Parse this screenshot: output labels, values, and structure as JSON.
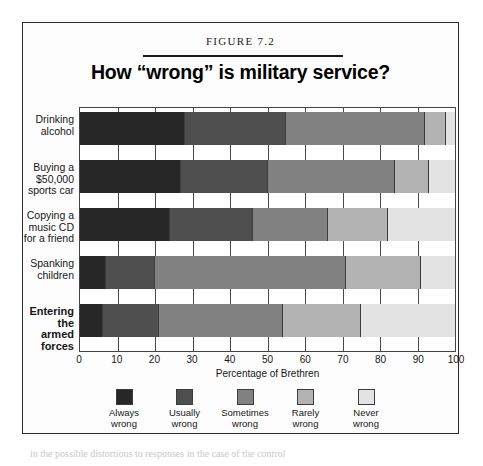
{
  "figure": {
    "number_label": "FIGURE 7.2",
    "title": "How “wrong” is military service?",
    "body_text_below": "in the possible distortions to responses in the case of the control"
  },
  "chart_data": {
    "type": "bar",
    "orientation": "horizontal",
    "stacked": true,
    "normalized": true,
    "title": "How “wrong” is military service?",
    "subtitle": "FIGURE 7.2",
    "xlabel": "Percentage of Brethren",
    "ylabel": "",
    "xlim": [
      0,
      100
    ],
    "xticks": [
      0,
      10,
      20,
      30,
      40,
      50,
      60,
      70,
      80,
      90,
      100
    ],
    "xtick_labels": [
      "0",
      "10",
      "20",
      "30",
      "40",
      "50",
      "60",
      "70",
      "80",
      "90",
      "100"
    ],
    "grid": true,
    "legend_position": "bottom",
    "categories": [
      "Drinking alcohol",
      "Buying a $50,000 sports car",
      "Copying a music CD for a friend",
      "Spanking children",
      "Entering the armed forces"
    ],
    "category_lines": [
      [
        "Drinking",
        "alcohol"
      ],
      [
        "Buying a",
        "$50,000",
        "sports car"
      ],
      [
        "Copying a",
        "music CD",
        "for a friend"
      ],
      [
        "Spanking",
        "children"
      ],
      [
        "Entering",
        "the",
        "armed",
        "forces"
      ]
    ],
    "category_emphasis": [
      false,
      false,
      false,
      false,
      true
    ],
    "series": [
      {
        "name": "Always wrong",
        "legend_lines": [
          "Always",
          "wrong"
        ],
        "color": "#272727",
        "values": [
          28,
          27,
          24,
          7,
          6
        ]
      },
      {
        "name": "Usually wrong",
        "legend_lines": [
          "Usually",
          "wrong"
        ],
        "color": "#4f4f4f",
        "values": [
          27,
          23,
          22,
          13,
          15
        ]
      },
      {
        "name": "Sometimes wrong",
        "legend_lines": [
          "Sometimes",
          "wrong"
        ],
        "color": "#828282",
        "values": [
          37,
          34,
          20,
          51,
          33
        ]
      },
      {
        "name": "Rarely wrong",
        "legend_lines": [
          "Rarely",
          "wrong"
        ],
        "color": "#b3b3b3",
        "values": [
          5.5,
          9,
          16,
          20,
          21
        ]
      },
      {
        "name": "Never wrong",
        "legend_lines": [
          "Never",
          "wrong"
        ],
        "color": "#e3e3e3",
        "values": [
          2.5,
          7,
          18,
          9,
          25
        ]
      }
    ]
  }
}
